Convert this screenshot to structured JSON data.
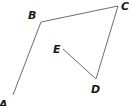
{
  "diagram": {
    "type": "polyline",
    "line_color": "#6e6e6e",
    "label_color": "#1a1a1a",
    "points": [
      {
        "id": "A",
        "label": "A",
        "x": 13,
        "y": 95,
        "label_x": -1,
        "label_y": 108
      },
      {
        "id": "B",
        "label": "B",
        "x": 41,
        "y": 22,
        "label_x": 28,
        "label_y": 19
      },
      {
        "id": "C",
        "label": "C",
        "x": 118,
        "y": 6,
        "label_x": 121,
        "label_y": 10
      },
      {
        "id": "D",
        "label": "D",
        "x": 96,
        "y": 79,
        "label_x": 91,
        "label_y": 93
      },
      {
        "id": "E",
        "label": "E",
        "x": 63,
        "y": 49,
        "label_x": 53,
        "label_y": 53
      }
    ],
    "segments": [
      {
        "from": "A",
        "to": "B"
      },
      {
        "from": "B",
        "to": "C"
      },
      {
        "from": "C",
        "to": "D"
      },
      {
        "from": "D",
        "to": "E"
      }
    ]
  }
}
